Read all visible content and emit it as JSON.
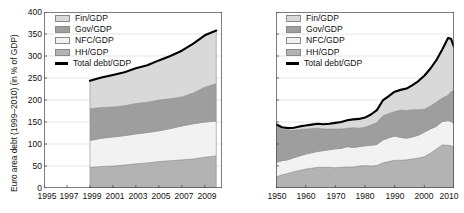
{
  "figure": {
    "background": "#ffffff",
    "panels": [
      "euro-area",
      "united-states"
    ]
  },
  "legend": {
    "items": [
      {
        "label": "Fin/GDP",
        "color": "#d9d9d9",
        "type": "area"
      },
      {
        "label": "Gov/GDP",
        "color": "#9e9e9e",
        "type": "area"
      },
      {
        "label": "NFC/GDP",
        "color": "#f2f2f2",
        "type": "area"
      },
      {
        "label": "HH/GDP",
        "color": "#b3b3b3",
        "type": "area"
      },
      {
        "label": "Total debt/GDP",
        "color": "#000000",
        "type": "line"
      }
    ]
  },
  "left": {
    "ylabel": "Euro area debt (1999–2010) (in % of GDP)",
    "yticks": [
      "0",
      "50",
      "100",
      "150",
      "200",
      "250",
      "300",
      "350",
      "400"
    ],
    "xticks": [
      "1995",
      "1997",
      "1999",
      "2001",
      "2003",
      "2005",
      "2007",
      "2009"
    ]
  },
  "right": {
    "ylabel": "US debt (1950–2010) (in % of GDP)",
    "yticks": [
      "0",
      "50",
      "100",
      "150",
      "200",
      "250",
      "300",
      "350",
      "400"
    ],
    "xticks": [
      "1950",
      "1960",
      "1970",
      "1980",
      "1990",
      "2000",
      "2010"
    ]
  },
  "chart_data": [
    {
      "id": "euro-area-debt",
      "type": "area",
      "stacked": true,
      "title": "",
      "xlabel": "",
      "ylabel": "Euro area debt (1999–2010) (in % of GDP)",
      "xlim": [
        1995,
        2010.5
      ],
      "ylim": [
        0,
        400
      ],
      "ytick_values": [
        0,
        50,
        100,
        150,
        200,
        250,
        300,
        350,
        400
      ],
      "xtick_values": [
        1995,
        1997,
        1999,
        2001,
        2003,
        2005,
        2007,
        2009
      ],
      "grid": "horizontal",
      "legend_position": "top-left",
      "note": "Data series begin in 1999; region left of 1999 is empty.",
      "x": [
        1999,
        2000,
        2001,
        2002,
        2003,
        2004,
        2005,
        2006,
        2007,
        2008,
        2009,
        2010
      ],
      "stack_order_bottom_to_top": [
        "HH/GDP",
        "NFC/GDP",
        "Gov/GDP",
        "Fin/GDP"
      ],
      "series": [
        {
          "name": "HH/GDP",
          "color": "#b3b3b3",
          "values": [
            47,
            49,
            50,
            52,
            55,
            57,
            60,
            62,
            64,
            66,
            70,
            73
          ]
        },
        {
          "name": "NFC/GDP",
          "color": "#f2f2f2",
          "values": [
            61,
            64,
            66,
            67,
            68,
            69,
            70,
            73,
            77,
            80,
            80,
            79
          ]
        },
        {
          "name": "Gov/GDP",
          "color": "#9e9e9e",
          "values": [
            72,
            70,
            68,
            68,
            69,
            69,
            70,
            68,
            66,
            70,
            79,
            85
          ]
        },
        {
          "name": "Fin/GDP",
          "color": "#d9d9d9",
          "values": [
            64,
            68,
            73,
            76,
            80,
            84,
            90,
            97,
            105,
            112,
            118,
            121
          ]
        }
      ],
      "total_line": {
        "name": "Total debt/GDP",
        "color": "#000000",
        "values": [
          244,
          251,
          257,
          263,
          272,
          279,
          290,
          300,
          312,
          328,
          347,
          358
        ]
      }
    },
    {
      "id": "us-debt",
      "type": "area",
      "stacked": true,
      "title": "",
      "xlabel": "",
      "ylabel": "US debt (1950–2010) (in % of GDP)",
      "xlim": [
        1950,
        2010
      ],
      "ylim": [
        0,
        400
      ],
      "ytick_values": [
        0,
        50,
        100,
        150,
        200,
        250,
        300,
        350,
        400
      ],
      "xtick_values": [
        1950,
        1960,
        1970,
        1980,
        1990,
        2000,
        2010
      ],
      "grid": "horizontal",
      "legend_position": "top-left",
      "x": [
        1950,
        1952,
        1954,
        1956,
        1958,
        1960,
        1962,
        1964,
        1966,
        1968,
        1970,
        1972,
        1974,
        1976,
        1978,
        1980,
        1982,
        1984,
        1986,
        1988,
        1990,
        1992,
        1994,
        1996,
        1998,
        2000,
        2002,
        2004,
        2006,
        2008,
        2009,
        2010
      ],
      "stack_order_bottom_to_top": [
        "HH/GDP",
        "NFC/GDP",
        "Gov/GDP",
        "Fin/GDP"
      ],
      "series": [
        {
          "name": "HH/GDP",
          "color": "#b3b3b3",
          "values": [
            25,
            30,
            33,
            37,
            40,
            43,
            45,
            47,
            47,
            47,
            46,
            47,
            48,
            48,
            50,
            51,
            50,
            51,
            57,
            60,
            63,
            63,
            64,
            66,
            68,
            71,
            79,
            88,
            98,
            97,
            96,
            92
          ]
        },
        {
          "name": "NFC/GDP",
          "color": "#f2f2f2",
          "values": [
            33,
            32,
            31,
            32,
            33,
            34,
            35,
            36,
            38,
            40,
            43,
            43,
            46,
            44,
            44,
            45,
            47,
            48,
            52,
            54,
            55,
            52,
            49,
            50,
            52,
            56,
            55,
            52,
            53,
            56,
            55,
            54
          ]
        },
        {
          "name": "Gov/GDP",
          "color": "#9e9e9e",
          "values": [
            84,
            72,
            67,
            62,
            60,
            57,
            55,
            53,
            49,
            47,
            45,
            44,
            42,
            45,
            42,
            42,
            46,
            50,
            55,
            55,
            56,
            62,
            63,
            62,
            58,
            52,
            52,
            55,
            53,
            58,
            68,
            75
          ]
        },
        {
          "name": "Fin/GDP",
          "color": "#d9d9d9",
          "values": [
            3,
            4,
            5,
            6,
            7,
            8,
            9,
            10,
            11,
            12,
            14,
            16,
            18,
            19,
            21,
            22,
            24,
            28,
            35,
            40,
            45,
            46,
            50,
            56,
            65,
            76,
            85,
            95,
            110,
            130,
            120,
            100
          ]
        }
      ],
      "total_line": {
        "name": "Total debt/GDP",
        "color": "#000000",
        "values": [
          145,
          138,
          136,
          137,
          140,
          142,
          144,
          146,
          145,
          146,
          148,
          150,
          154,
          156,
          157,
          160,
          167,
          177,
          199,
          209,
          219,
          223,
          226,
          234,
          243,
          255,
          271,
          290,
          314,
          341,
          339,
          321
        ]
      }
    }
  ]
}
